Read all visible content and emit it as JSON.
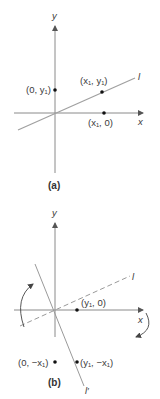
{
  "colors": {
    "axis": "#8a8a8a",
    "line": "#9a9a9a",
    "point": "#111111",
    "text": "#3a3a3a"
  },
  "panel_a": {
    "caption": "(a)",
    "axis_x_label": "x",
    "axis_y_label": "y",
    "line_label": "l",
    "points": [
      {
        "name": "point-0-y1",
        "label": "(0, y₁)"
      },
      {
        "name": "point-x1-y1",
        "label": "(x₁, y₁)"
      },
      {
        "name": "point-x1-0",
        "label": "(x₁, 0)"
      }
    ]
  },
  "panel_b": {
    "caption": "(b)",
    "axis_x_label": "x",
    "axis_y_label": "y",
    "dashed_line_label": "l",
    "rotated_line_label": "l′",
    "points": [
      {
        "name": "point-y1-0",
        "label": "(y₁, 0)"
      },
      {
        "name": "point-0-negx1",
        "label": "(0, −x₁)"
      },
      {
        "name": "point-y1-negx1",
        "label": "(y₁, −x₁)"
      }
    ]
  }
}
